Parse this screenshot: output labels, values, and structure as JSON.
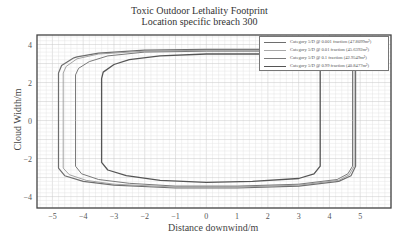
{
  "chart_data": {
    "type": "line",
    "title": "Toxic Outdoor Lethality Footprint",
    "subtitle": "Location specific breach 300",
    "xlabel": "Distance downwind/m",
    "ylabel": "Cloud Width/m",
    "xlim": [
      -5.5,
      6.0
    ],
    "ylim": [
      -4.6,
      4.5
    ],
    "xticks": [
      -5,
      -4,
      -3,
      -2,
      -1,
      0,
      1,
      2,
      3,
      4,
      5
    ],
    "yticks": [
      -4,
      -2,
      0,
      2,
      4
    ],
    "grid": true,
    "legend_position": "upper right",
    "series": [
      {
        "name": "Category 5/D @ 0.001 fraction (47.8099m²)",
        "color": "#6e6e6e",
        "width": 1.2,
        "x": [
          -4.3,
          -4.7,
          -4.8,
          -4.8,
          -4.8,
          -4.6,
          -4.0,
          -3.0,
          -1.0,
          1.0,
          3.0,
          4.3,
          4.7,
          4.85,
          4.85,
          4.85,
          4.7,
          4.2,
          3.8,
          3.7,
          2.0,
          0.0,
          -2.0,
          -3.5,
          -4.2,
          -4.3
        ],
        "y": [
          3.3,
          2.9,
          2.5,
          0.0,
          -2.5,
          -2.9,
          -3.2,
          -3.4,
          -3.55,
          -3.55,
          -3.45,
          -3.2,
          -2.9,
          -2.4,
          0.0,
          3.4,
          3.7,
          3.75,
          3.75,
          3.75,
          3.75,
          3.75,
          3.7,
          3.55,
          3.35,
          3.3
        ]
      },
      {
        "name": "Category 5/D @ 0.01 fraction (45.6392m²)",
        "color": "#9a9a9a",
        "width": 0.9,
        "x": [
          -4.2,
          -4.55,
          -4.65,
          -4.65,
          -4.65,
          -4.45,
          -3.9,
          -3.0,
          -1.0,
          1.0,
          3.0,
          4.3,
          4.65,
          4.8,
          4.8,
          4.8,
          4.65,
          4.2,
          2.0,
          0.0,
          -2.0,
          -3.5,
          -4.2
        ],
        "y": [
          3.25,
          2.85,
          2.5,
          0.0,
          -2.5,
          -2.85,
          -3.15,
          -3.35,
          -3.5,
          -3.5,
          -3.4,
          -3.15,
          -2.85,
          -2.4,
          0.0,
          3.35,
          3.65,
          3.7,
          3.7,
          3.7,
          3.65,
          3.5,
          3.25
        ]
      },
      {
        "name": "Category 5/D @ 0.1 fraction (42.9549m²)",
        "color": "#7a7a7a",
        "width": 1.0,
        "x": [
          -3.8,
          -4.15,
          -4.25,
          -4.25,
          -4.25,
          -4.05,
          -3.5,
          -2.5,
          -1.0,
          1.0,
          3.0,
          4.25,
          4.6,
          4.75,
          4.75,
          4.75,
          4.6,
          4.1,
          2.0,
          0.0,
          -2.0,
          -3.2,
          -3.8
        ],
        "y": [
          3.1,
          2.75,
          2.4,
          0.0,
          -2.4,
          -2.8,
          -3.1,
          -3.3,
          -3.45,
          -3.45,
          -3.35,
          -3.1,
          -2.8,
          -2.4,
          0.0,
          3.3,
          3.6,
          3.65,
          3.65,
          3.65,
          3.6,
          3.4,
          3.1
        ]
      },
      {
        "name": "Category 5/D @ 0.99 fraction (40.8477m²)",
        "color": "#555555",
        "width": 1.3,
        "x": [
          -3.0,
          -3.35,
          -3.4,
          -3.4,
          -3.4,
          -3.2,
          -2.6,
          -1.5,
          0.0,
          1.5,
          3.0,
          3.5,
          3.7,
          3.7,
          3.7,
          3.5,
          3.0,
          2.0,
          0.0,
          -1.5,
          -2.5,
          -3.0
        ],
        "y": [
          2.95,
          2.55,
          2.2,
          0.0,
          -2.2,
          -2.6,
          -2.9,
          -3.15,
          -3.25,
          -3.2,
          -3.05,
          -2.8,
          -2.4,
          0.0,
          3.2,
          3.45,
          3.5,
          3.5,
          3.5,
          3.4,
          3.2,
          2.95
        ]
      }
    ]
  },
  "legend": {
    "items": [
      {
        "label": "Category 5/D @ 0.001 fraction  (47.8099m²)",
        "color": "#6e6e6e"
      },
      {
        "label": "Category 5/D @ 0.01  fraction  (45.6392m²)",
        "color": "#a8a8a8"
      },
      {
        "label": "Category 5/D @ 0.1  fraction  (42.9549m²)",
        "color": "#7a7a7a"
      },
      {
        "label": "Category 5/D @ 0.99 fraction  (40.8477m²)",
        "color": "#555555"
      }
    ]
  },
  "axes": {
    "xticklabels": [
      "−5",
      "−4",
      "−3",
      "−2",
      "−1",
      "0",
      "1",
      "2",
      "3",
      "4",
      "5"
    ],
    "yticklabels": [
      "4",
      "2",
      "0",
      "−2",
      "−4"
    ]
  }
}
